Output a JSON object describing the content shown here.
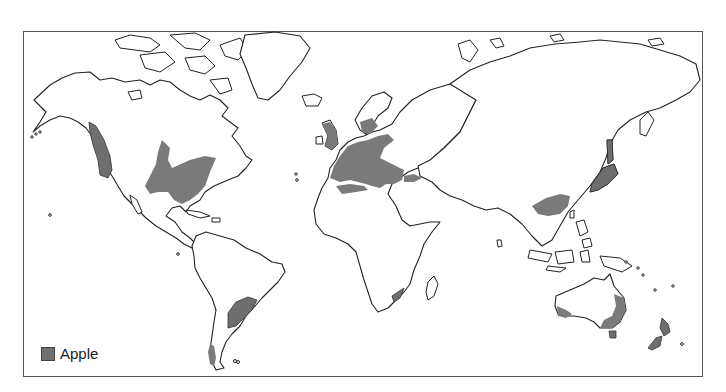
{
  "map": {
    "title": "",
    "projection": "world outline",
    "legend": {
      "items": [
        {
          "label": "Apple",
          "color": "#6f6f6f"
        }
      ]
    },
    "shaded_regions": [
      "Pacific Northwest (North America)",
      "Eastern / Midwestern United States",
      "Europe",
      "Scandinavia (southern)",
      "North Africa coast",
      "Turkey / Caucasus",
      "Eastern China",
      "Japan",
      "Argentina / Uruguay",
      "Southern Chile",
      "South Africa (Cape)",
      "Southeast Australia",
      "Southwest Australia",
      "Tasmania",
      "New Zealand"
    ],
    "colors": {
      "shade": "#7a7a7a",
      "outline": "#222222",
      "background": "#ffffff"
    }
  }
}
